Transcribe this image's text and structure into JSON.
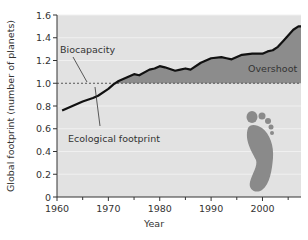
{
  "chart_data": {
    "type": "area",
    "title": "",
    "xlabel": "Year",
    "ylabel": "Global footprint (number of planets)",
    "xlim": [
      1960,
      2007.5
    ],
    "ylim": [
      0,
      1.6
    ],
    "x_ticks": [
      1960,
      1970,
      1980,
      1990,
      2000
    ],
    "x_minor_ticks": [
      1965,
      1975,
      1985,
      1995,
      2005
    ],
    "y_ticks": [
      0,
      0.2,
      0.4,
      0.6,
      0.8,
      1.0,
      1.2,
      1.4,
      1.6
    ],
    "y_tick_labels": [
      "0",
      "0.2",
      "0.4",
      "0.6",
      "0.8",
      "1.0",
      "1.2",
      "1.4",
      "1.6"
    ],
    "grid": true,
    "legend": null,
    "series": [
      {
        "name": "Ecological footprint",
        "style": "line",
        "x": [
          1961,
          1963,
          1965,
          1967,
          1968,
          1970,
          1971,
          1972,
          1974,
          1975,
          1976,
          1978,
          1979,
          1980,
          1981,
          1983,
          1984,
          1985,
          1986,
          1988,
          1990,
          1992,
          1993,
          1994,
          1996,
          1998,
          2000,
          2001,
          2002,
          2003,
          2004,
          2005,
          2006,
          2007
        ],
        "values": [
          0.76,
          0.8,
          0.84,
          0.87,
          0.89,
          0.95,
          0.99,
          1.02,
          1.06,
          1.08,
          1.07,
          1.12,
          1.13,
          1.15,
          1.14,
          1.11,
          1.12,
          1.13,
          1.12,
          1.18,
          1.22,
          1.23,
          1.22,
          1.21,
          1.25,
          1.26,
          1.26,
          1.28,
          1.29,
          1.32,
          1.37,
          1.42,
          1.47,
          1.5
        ]
      },
      {
        "name": "Biocapacity",
        "style": "dashed",
        "x": [
          1960,
          2007.5
        ],
        "values": [
          1.0,
          1.0
        ]
      }
    ],
    "annotations": [
      {
        "text": "Biocapacity",
        "points_to": "dashed line at 1.0 near 1970"
      },
      {
        "text": "Ecological footprint",
        "points_to": "footprint line near 1968"
      },
      {
        "text": "Overshoot",
        "region": "area between footprint line and 1.0 after ~1971",
        "fill": "#8c8c8c"
      }
    ],
    "colors": {
      "plot_background": "#e2e2e2",
      "overshoot_fill": "#8c8c8c",
      "line": "#111111",
      "dashed": "#555555",
      "footprint_icon": "#8a8a8a"
    }
  },
  "labels": {
    "biocapacity": "Biocapacity",
    "ecological_footprint": "Ecological footprint",
    "overshoot": "Overshoot",
    "xlabel": "Year",
    "ylabel": "Global footprint (number of planets)"
  },
  "decoration": {
    "icon": "footprint-icon"
  }
}
